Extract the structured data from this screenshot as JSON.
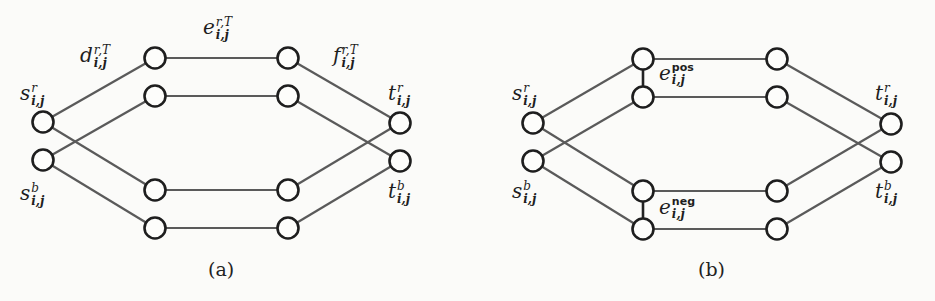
{
  "panels": [
    {
      "id": "a",
      "caption": "(a)",
      "labels": {
        "s_r": {
          "base": "s",
          "sup": "r",
          "sub": "i,j"
        },
        "s_b": {
          "base": "s",
          "sup": "b",
          "sub": "i,j"
        },
        "t_r": {
          "base": "t",
          "sup": "r",
          "sub": "i,j"
        },
        "t_b": {
          "base": "t",
          "sup": "b",
          "sub": "i,j"
        },
        "d": {
          "base": "d",
          "sup": "r,T",
          "sub": "i,j"
        },
        "e": {
          "base": "e",
          "sup": "r,T",
          "sub": "i,j"
        },
        "f": {
          "base": "f",
          "sup": "r,T",
          "sub": "i,j"
        }
      },
      "nodes": [
        {
          "id": "s_r",
          "x": 43,
          "y": 122
        },
        {
          "id": "s_b",
          "x": 43,
          "y": 160
        },
        {
          "id": "l1",
          "x": 155,
          "y": 58
        },
        {
          "id": "l2",
          "x": 155,
          "y": 96
        },
        {
          "id": "l3",
          "x": 155,
          "y": 190
        },
        {
          "id": "l4",
          "x": 155,
          "y": 228
        },
        {
          "id": "r1",
          "x": 288,
          "y": 58
        },
        {
          "id": "r2",
          "x": 288,
          "y": 96
        },
        {
          "id": "r3",
          "x": 288,
          "y": 190
        },
        {
          "id": "r4",
          "x": 288,
          "y": 228
        },
        {
          "id": "t_r",
          "x": 400,
          "y": 123
        },
        {
          "id": "t_b",
          "x": 400,
          "y": 161
        }
      ],
      "edges": [
        [
          "s_r",
          "l1"
        ],
        [
          "s_b",
          "l2"
        ],
        [
          "s_r",
          "l3"
        ],
        [
          "s_b",
          "l4"
        ],
        [
          "l1",
          "r1"
        ],
        [
          "l2",
          "r2"
        ],
        [
          "l3",
          "r3"
        ],
        [
          "l4",
          "r4"
        ],
        [
          "r1",
          "t_r"
        ],
        [
          "r2",
          "t_b"
        ],
        [
          "r3",
          "t_r"
        ],
        [
          "r4",
          "t_b"
        ]
      ]
    },
    {
      "id": "b",
      "caption": "(b)",
      "labels": {
        "s_r": {
          "base": "s",
          "sup": "r",
          "sub": "i,j"
        },
        "s_b": {
          "base": "s",
          "sup": "b",
          "sub": "i,j"
        },
        "t_r": {
          "base": "t",
          "sup": "r",
          "sub": "i,j"
        },
        "t_b": {
          "base": "t",
          "sup": "b",
          "sub": "i,j"
        },
        "e_pos": {
          "base": "e",
          "sup": "pos",
          "sub": "i,j"
        },
        "e_neg": {
          "base": "e",
          "sup": "neg",
          "sub": "i,j"
        }
      },
      "nodes": [
        {
          "id": "s_r",
          "x": 533,
          "y": 123
        },
        {
          "id": "s_b",
          "x": 533,
          "y": 161
        },
        {
          "id": "l1",
          "x": 643,
          "y": 59
        },
        {
          "id": "l2",
          "x": 643,
          "y": 97
        },
        {
          "id": "l3",
          "x": 643,
          "y": 191
        },
        {
          "id": "l4",
          "x": 643,
          "y": 229
        },
        {
          "id": "r1",
          "x": 777,
          "y": 59
        },
        {
          "id": "r2",
          "x": 777,
          "y": 97
        },
        {
          "id": "r3",
          "x": 777,
          "y": 191
        },
        {
          "id": "r4",
          "x": 777,
          "y": 229
        },
        {
          "id": "t_r",
          "x": 891,
          "y": 124
        },
        {
          "id": "t_b",
          "x": 891,
          "y": 162
        }
      ],
      "edges": [
        [
          "s_r",
          "l1"
        ],
        [
          "s_b",
          "l2"
        ],
        [
          "s_r",
          "l3"
        ],
        [
          "s_b",
          "l4"
        ],
        [
          "l1",
          "r1"
        ],
        [
          "l2",
          "r2"
        ],
        [
          "l3",
          "r3"
        ],
        [
          "l4",
          "r4"
        ],
        [
          "r1",
          "t_r"
        ],
        [
          "r2",
          "t_b"
        ],
        [
          "r3",
          "t_r"
        ],
        [
          "r4",
          "t_b"
        ]
      ],
      "dark_edges": [
        [
          "l1",
          "l2"
        ],
        [
          "l3",
          "l4"
        ]
      ]
    }
  ]
}
